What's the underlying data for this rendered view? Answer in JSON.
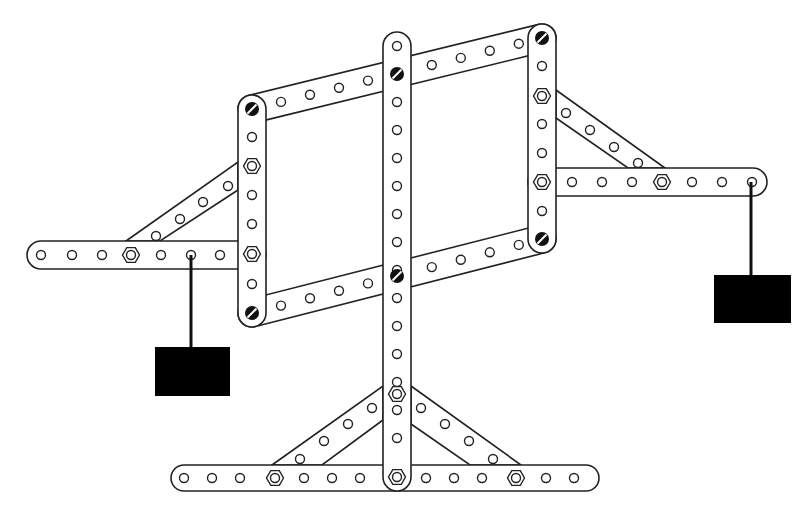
{
  "diagram": {
    "title": "Meccano balance model",
    "colors": {
      "stroke": "#222222",
      "fill": "#ffffff",
      "weight": "#000000",
      "bolt": "#111111"
    },
    "strips": [
      {
        "name": "central-upright",
        "x1": 397,
        "y1": 46,
        "x2": 397,
        "y2": 477,
        "width": 28,
        "holes": [
          46,
          74,
          102,
          130,
          158,
          186,
          214,
          242,
          270,
          298,
          326,
          354,
          382,
          410,
          438,
          477
        ],
        "nuts": [
          394,
          477
        ],
        "bolts": [
          74,
          276
        ]
      },
      {
        "name": "base-strip",
        "x1": 184,
        "y1": 478,
        "x2": 586,
        "y2": 478,
        "width": 26,
        "holes": [
          184,
          212,
          240,
          304,
          332,
          360,
          426,
          454,
          482,
          546,
          574
        ],
        "nuts": [
          275,
          516
        ]
      },
      {
        "name": "left-upright",
        "x1": 252,
        "y1": 109,
        "x2": 252,
        "y2": 313,
        "width": 28,
        "holes": [
          137,
          164,
          195,
          224,
          284
        ],
        "nuts": [
          166,
          254
        ],
        "bolts": [
          109,
          313
        ]
      },
      {
        "name": "right-upright",
        "x1": 542,
        "y1": 38,
        "x2": 542,
        "y2": 239,
        "width": 28,
        "holes": [
          66,
          124,
          153,
          211
        ],
        "nuts": [
          96,
          182
        ],
        "bolts": [
          38,
          239
        ]
      },
      {
        "name": "top-link",
        "x1": 252,
        "y1": 109,
        "x2": 542,
        "y2": 38,
        "width": 28,
        "holes": [
          0.1,
          0.2,
          0.3,
          0.4,
          0.62,
          0.72,
          0.82,
          0.92
        ]
      },
      {
        "name": "bottom-link",
        "x1": 252,
        "y1": 313,
        "x2": 542,
        "y2": 239,
        "width": 28,
        "holes": [
          0.1,
          0.2,
          0.3,
          0.4,
          0.62,
          0.72,
          0.82,
          0.92
        ]
      },
      {
        "name": "left-arm",
        "x1": 41,
        "y1": 255,
        "x2": 252,
        "y2": 255,
        "width": 28,
        "holes": [
          41,
          72,
          102,
          161,
          191,
          220
        ],
        "nuts": [
          131
        ]
      },
      {
        "name": "right-arm",
        "x1": 542,
        "y1": 182,
        "x2": 753,
        "y2": 182,
        "width": 28,
        "holes": [
          572,
          602,
          632,
          692,
          722,
          752
        ],
        "nuts": [
          662
        ]
      }
    ],
    "braces": [
      {
        "name": "left-arm-brace",
        "points": [
          [
            126,
            241
          ],
          [
            238,
            162
          ],
          [
            238,
            190
          ],
          [
            160,
            241
          ]
        ],
        "holes": [
          [
            156,
            236
          ],
          [
            180,
            219
          ],
          [
            203,
            202
          ],
          [
            228,
            186
          ]
        ]
      },
      {
        "name": "right-arm-brace",
        "points": [
          [
            556,
            90
          ],
          [
            665,
            168
          ],
          [
            628,
            168
          ],
          [
            556,
            118
          ]
        ],
        "holes": [
          [
            566,
            113
          ],
          [
            590,
            130
          ],
          [
            614,
            147
          ],
          [
            638,
            163
          ]
        ]
      },
      {
        "name": "base-left-brace",
        "points": [
          [
            272,
            465
          ],
          [
            383,
            386
          ],
          [
            383,
            420
          ],
          [
            322,
            465
          ]
        ],
        "holes": [
          [
            300,
            459
          ],
          [
            324,
            441
          ],
          [
            348,
            424
          ],
          [
            372,
            408
          ]
        ]
      },
      {
        "name": "base-right-brace",
        "points": [
          [
            411,
            386
          ],
          [
            521,
            465
          ],
          [
            470,
            465
          ],
          [
            411,
            424
          ]
        ],
        "holes": [
          [
            421,
            408
          ],
          [
            445,
            424
          ],
          [
            469,
            441
          ],
          [
            493,
            459
          ]
        ]
      }
    ],
    "weights": [
      {
        "name": "left-weight",
        "string_x": 191,
        "string_y1": 255,
        "string_y2": 347,
        "x": 155,
        "y": 347,
        "w": 75,
        "h": 49
      },
      {
        "name": "right-weight",
        "string_x": 751,
        "string_y1": 182,
        "string_y2": 275,
        "x": 714,
        "y": 275,
        "w": 77,
        "h": 48
      }
    ]
  }
}
